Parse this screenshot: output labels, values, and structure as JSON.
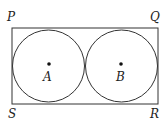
{
  "diagram": {
    "type": "geometry",
    "vertices": {
      "P": "P",
      "Q": "Q",
      "R": "R",
      "S": "S"
    },
    "centers": {
      "A": "A",
      "B": "B"
    },
    "colors": {
      "stroke": "#333333",
      "background": "#ffffff"
    }
  }
}
